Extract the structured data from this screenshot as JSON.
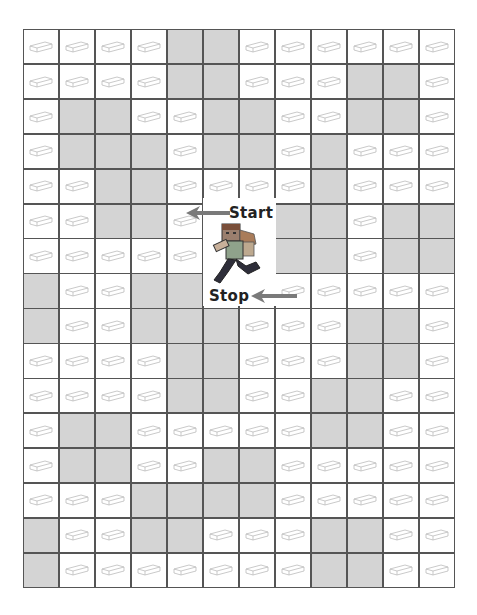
{
  "puzzle": {
    "type": "maze",
    "columns": 12,
    "rows": 16,
    "legend": {
      "B": "brick-path",
      "G": "gray-wall",
      "F": "figure-area"
    },
    "grid": [
      "BBBBGGBBBBBB",
      "BBBBGGBBBGGB",
      "BGGBBGGBBGGB",
      "BGGGBGGBGBBB",
      "BBGGBBBBGBBB",
      "BBGGBFFGGBGG",
      "BBBBBFFGGBGG",
      "GBBGGFFBBBBB",
      "GBBGGGBBBGGB",
      "BBBBGGBBBGGB",
      "BBBBGGBBGGBB",
      "BGGBBBBBGGBB",
      "BGGBBGGBBBBB",
      "BBBGGGGBBBBB",
      "GBBGGBBBGGBB",
      "GBBBBBBBGGBB"
    ],
    "colors": {
      "wall": "#d4d4d4",
      "gridline": "#555555",
      "path": "#ffffff",
      "arrow": "#7a7a7a"
    }
  },
  "labels": {
    "start": "Start",
    "stop": "Stop"
  },
  "icons": {
    "brick": "brick-icon",
    "runner": "minecraft-runner-icon",
    "start_arrow": "arrow-left-icon",
    "stop_arrow": "arrow-left-icon"
  }
}
